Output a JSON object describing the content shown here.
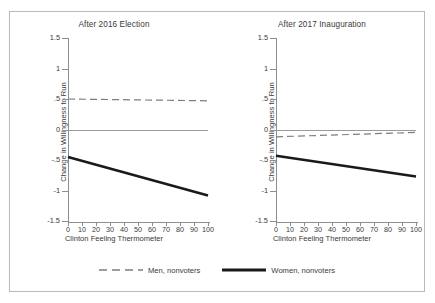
{
  "chart_data": {
    "type": "line",
    "title": "",
    "panels": [
      {
        "title": "After 2016 Election",
        "xlabel": "Clinton Feeling Thermometer",
        "ylabel": "Change in Willingness to Run",
        "xlim": [
          0,
          100
        ],
        "ylim": [
          -1.5,
          1.5
        ],
        "xticks": [
          0,
          10,
          20,
          30,
          40,
          50,
          60,
          70,
          80,
          90,
          100
        ],
        "xticklabels": [
          "0",
          "10",
          "20",
          "30",
          "40",
          "50",
          "60",
          "70",
          "80",
          "90",
          "100"
        ],
        "yticks": [
          1.5,
          1,
          0.5,
          0,
          -0.5,
          -1,
          -1.5
        ],
        "yticklabels": [
          "1.5",
          "1",
          ".5",
          "0",
          "-.5",
          "-1",
          "-1.5"
        ],
        "zero_reference_line": 0,
        "series": [
          {
            "name": "Men, nonvoters",
            "style": "dashed",
            "x": [
              0,
              100
            ],
            "values": [
              0.5,
              0.47
            ]
          },
          {
            "name": "Women, nonvoters",
            "style": "solid",
            "x": [
              0,
              100
            ],
            "values": [
              -0.45,
              -1.08
            ]
          }
        ]
      },
      {
        "title": "After 2017 Inauguration",
        "xlabel": "Clinton Feeling Thermometer",
        "ylabel": "Change in Willingness to Run",
        "xlim": [
          0,
          100
        ],
        "ylim": [
          -1.5,
          1.5
        ],
        "xticks": [
          0,
          10,
          20,
          30,
          40,
          50,
          60,
          70,
          80,
          90,
          100
        ],
        "xticklabels": [
          "0",
          "10",
          "20",
          "30",
          "40",
          "50",
          "60",
          "70",
          "80",
          "90",
          "100"
        ],
        "yticks": [
          1.5,
          1,
          0.5,
          0,
          -0.5,
          -1,
          -1.5
        ],
        "yticklabels": [
          "1.5",
          "1",
          ".5",
          "0",
          "-.5",
          "-1",
          "-1.5"
        ],
        "zero_reference_line": 0,
        "series": [
          {
            "name": "Men, nonvoters",
            "style": "dashed",
            "x": [
              0,
              100
            ],
            "values": [
              -0.12,
              -0.04
            ]
          },
          {
            "name": "Women, nonvoters",
            "style": "solid",
            "x": [
              0,
              100
            ],
            "values": [
              -0.43,
              -0.77
            ]
          }
        ]
      }
    ],
    "legend": {
      "position": "bottom-center",
      "entries": [
        {
          "label": "Men, nonvoters",
          "style": "dashed",
          "color": "#7d7d7d"
        },
        {
          "label": "Women, nonvoters",
          "style": "solid",
          "color": "#1a1a1a"
        }
      ]
    },
    "grid": false,
    "colors": {
      "men_line": "#7d7d7d",
      "women_line": "#1a1a1a",
      "axis": "#8e8e8e",
      "zero_line": "#9a9a9a",
      "frame": "#b9b9b9",
      "text": "#3a3a3a",
      "background": "#ffffff"
    }
  }
}
